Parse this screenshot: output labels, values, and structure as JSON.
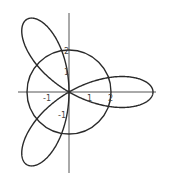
{
  "chart_data": {
    "type": "line",
    "subtype": "polar-curves",
    "title": "",
    "xlabel": "",
    "ylabel": "",
    "series": [
      {
        "name": "rose",
        "equation": "r = 4cos(3θ)",
        "petals": 3,
        "amplitude": 4,
        "petal_angles_deg": [
          0,
          120,
          240
        ]
      },
      {
        "name": "circle",
        "equation": "r = 2",
        "radius": 2
      }
    ],
    "x_ticks": [
      -1,
      1,
      2
    ],
    "y_ticks": [
      2,
      1,
      -1
    ],
    "x_tick_labels": [
      "-1",
      "1",
      "2"
    ],
    "y_tick_labels": [
      "2",
      "1",
      "-1"
    ],
    "xlim": [
      -2.4,
      4.2
    ],
    "ylim": [
      -3.8,
      3.8
    ],
    "grid": false,
    "legend": "none"
  },
  "layout": {
    "origin_px": [
      69,
      92
    ],
    "unit_px": 21
  },
  "labels": {
    "x_neg1": "-1",
    "x_1": "1",
    "x_2": "2",
    "y_2": "2",
    "y_1": "1",
    "y_neg1": "-1"
  }
}
